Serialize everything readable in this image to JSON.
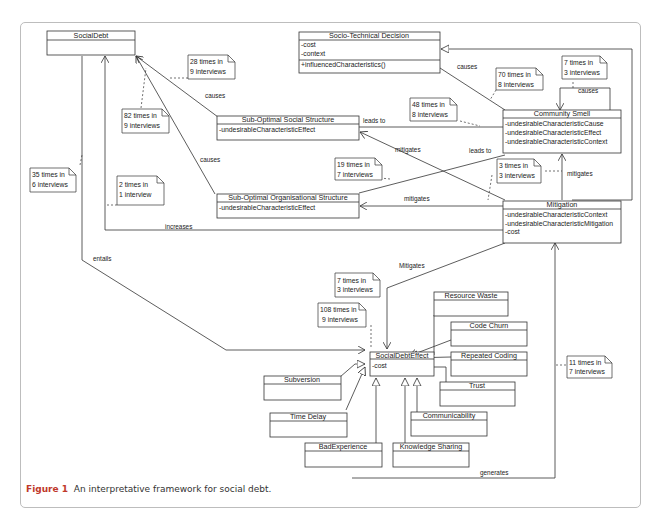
{
  "classes": {
    "social_debt": {
      "title": "SocialDebt"
    },
    "socio_technical_decision": {
      "title": "Socio-Technical Decision",
      "attributes": [
        "-cost",
        "-context"
      ],
      "methods": [
        "+influencedCharacteristics()"
      ]
    },
    "sub_optimal_social_structure": {
      "title": "Sub-Optimal Social Structure",
      "attributes": [
        "-undesirableCharacteristicEffect"
      ]
    },
    "sub_optimal_organisational_structure": {
      "title": "Sub-Optimal Organisational Structure",
      "attributes": [
        "-undesirableCharacteristicEffect"
      ]
    },
    "community_smell": {
      "title": "Community Smell",
      "attributes": [
        "-undesirableCharacteristicCause",
        "-undesirableCharacteristicEffect",
        "-undesirableCharacteristicContext"
      ]
    },
    "mitigation": {
      "title": "Mitigation",
      "attributes": [
        "-undesirableCharacteristicContext",
        "-undesirableCharacteristicMitigation",
        "-cost"
      ]
    },
    "social_debt_effect": {
      "title": "SocialDebtEffect",
      "attributes": [
        "-cost"
      ]
    },
    "resource_waste": {
      "title": "Resource Waste"
    },
    "code_churn": {
      "title": "Code Churn"
    },
    "repeated_coding": {
      "title": "Repeated Coding"
    },
    "trust": {
      "title": "Trust"
    },
    "communicability": {
      "title": "Communicability"
    },
    "knowledge_sharing": {
      "title": "Knowledge Sharing"
    },
    "bad_experience": {
      "title": "BadExperience"
    },
    "time_delay": {
      "title": "Time Delay"
    },
    "subversion": {
      "title": "Subversion"
    }
  },
  "relations": {
    "causes_1": "causes",
    "causes_2": "causes",
    "causes_3": "causes",
    "causes_4": "causes",
    "leads_to_1": "leads to",
    "leads_to_2": "leads to",
    "mitigates_1": "mitigates",
    "mitigates_2": "mitigates",
    "mitigates_3": "mitigates",
    "mitigates_4": "Mitigates",
    "increases": "increases",
    "entails": "entails",
    "generates": "generates"
  },
  "notes": [
    {
      "line1": "28 times in",
      "line2": "9 interviews"
    },
    {
      "line1": "82 times in",
      "line2": "9 interviews"
    },
    {
      "line1": "35 times in",
      "line2": "6 interviews"
    },
    {
      "line1": "2 times in",
      "line2": "1 interview"
    },
    {
      "line1": "70 times in",
      "line2": "8 interviews"
    },
    {
      "line1": "7 times in",
      "line2": "3 interviews"
    },
    {
      "line1": "48 times in",
      "line2": "8 interviews"
    },
    {
      "line1": "19 times in",
      "line2": "7 interviews"
    },
    {
      "line1": "3 times in",
      "line2": "3 interviews"
    },
    {
      "line1": "7 times in",
      "line2": "3 interviews"
    },
    {
      "line1": "108 times in",
      "line2": "9 interviews"
    },
    {
      "line1": "11 times in",
      "line2": "7 interviews"
    }
  ],
  "caption": {
    "label": "Figure 1",
    "text": "An interpretative framework for social debt."
  }
}
